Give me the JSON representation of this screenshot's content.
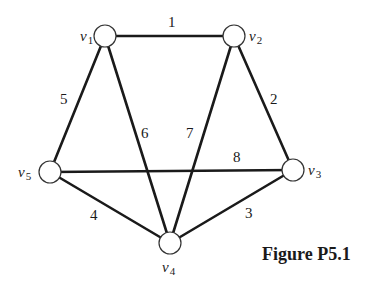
{
  "figure": {
    "caption": "Figure P5.1",
    "nodes": [
      {
        "id": "v1",
        "letter": "v",
        "sub": "1",
        "x": 105,
        "y": 36,
        "lx": 80,
        "ly": 41
      },
      {
        "id": "v2",
        "letter": "v",
        "sub": "2",
        "x": 234,
        "y": 36,
        "lx": 249,
        "ly": 41
      },
      {
        "id": "v3",
        "letter": "v",
        "sub": "3",
        "x": 293,
        "y": 170,
        "lx": 308,
        "ly": 175
      },
      {
        "id": "v4",
        "letter": "v",
        "sub": "4",
        "x": 170,
        "y": 243,
        "lx": 162,
        "ly": 272
      },
      {
        "id": "v5",
        "letter": "v",
        "sub": "5",
        "x": 50,
        "y": 172,
        "lx": 18,
        "ly": 177
      }
    ],
    "edges": [
      {
        "from": "v1",
        "to": "v2",
        "weight": "1",
        "wx": 168,
        "wy": 27
      },
      {
        "from": "v2",
        "to": "v3",
        "weight": "2",
        "wx": 270,
        "wy": 104
      },
      {
        "from": "v3",
        "to": "v4",
        "weight": "3",
        "wx": 245,
        "wy": 218
      },
      {
        "from": "v4",
        "to": "v5",
        "weight": "4",
        "wx": 90,
        "wy": 220
      },
      {
        "from": "v5",
        "to": "v1",
        "weight": "5",
        "wx": 60,
        "wy": 104
      },
      {
        "from": "v1",
        "to": "v4",
        "weight": "6",
        "wx": 141,
        "wy": 138
      },
      {
        "from": "v2",
        "to": "v4",
        "weight": "7",
        "wx": 186,
        "wy": 138
      },
      {
        "from": "v5",
        "to": "v3",
        "weight": "8",
        "wx": 233,
        "wy": 162
      }
    ]
  }
}
